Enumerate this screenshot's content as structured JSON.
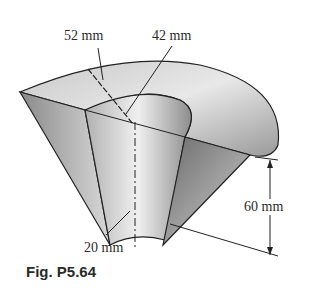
{
  "figure": {
    "caption": "Fig. P5.64",
    "dimensions": {
      "outer_radius": "52 mm",
      "inner_radius": "42 mm",
      "height": "60 mm",
      "bottom_radius": "20 mm"
    },
    "colors": {
      "line": "#222222",
      "shade_dark": "#7a7a7a",
      "shade_light": "#e6e6e6",
      "background": "#ffffff"
    }
  }
}
